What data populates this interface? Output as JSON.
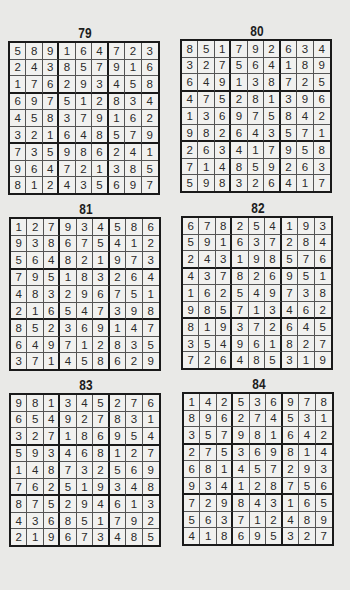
{
  "puzzles": [
    {
      "number": "79",
      "grid": [
        [
          5,
          8,
          9,
          1,
          6,
          4,
          7,
          2,
          3
        ],
        [
          2,
          4,
          3,
          8,
          5,
          7,
          9,
          1,
          6
        ],
        [
          1,
          7,
          6,
          2,
          9,
          3,
          4,
          5,
          8
        ],
        [
          6,
          9,
          7,
          5,
          1,
          2,
          8,
          3,
          4
        ],
        [
          4,
          5,
          8,
          3,
          7,
          9,
          1,
          6,
          2
        ],
        [
          3,
          2,
          1,
          6,
          4,
          8,
          5,
          7,
          9
        ],
        [
          7,
          3,
          5,
          9,
          8,
          6,
          2,
          4,
          1
        ],
        [
          9,
          6,
          4,
          7,
          2,
          1,
          3,
          8,
          5
        ],
        [
          8,
          1,
          2,
          4,
          3,
          5,
          6,
          9,
          7
        ]
      ]
    },
    {
      "number": "80",
      "grid": [
        [
          8,
          5,
          1,
          7,
          9,
          2,
          6,
          3,
          4
        ],
        [
          3,
          2,
          7,
          5,
          6,
          4,
          1,
          8,
          9
        ],
        [
          6,
          4,
          9,
          1,
          3,
          8,
          7,
          2,
          5
        ],
        [
          4,
          7,
          5,
          2,
          8,
          1,
          3,
          9,
          6
        ],
        [
          1,
          3,
          6,
          9,
          7,
          5,
          8,
          4,
          2
        ],
        [
          9,
          8,
          2,
          6,
          4,
          3,
          5,
          7,
          1
        ],
        [
          2,
          6,
          3,
          4,
          1,
          7,
          9,
          5,
          8
        ],
        [
          7,
          1,
          4,
          8,
          5,
          9,
          2,
          6,
          3
        ],
        [
          5,
          9,
          8,
          3,
          2,
          6,
          4,
          1,
          7
        ]
      ]
    },
    {
      "number": "81",
      "grid": [
        [
          1,
          2,
          7,
          9,
          3,
          4,
          5,
          8,
          6
        ],
        [
          9,
          3,
          8,
          6,
          7,
          5,
          4,
          1,
          2
        ],
        [
          5,
          6,
          4,
          8,
          2,
          1,
          9,
          7,
          3
        ],
        [
          7,
          9,
          5,
          1,
          8,
          3,
          2,
          6,
          4
        ],
        [
          4,
          8,
          3,
          2,
          9,
          6,
          7,
          5,
          1
        ],
        [
          2,
          1,
          6,
          5,
          4,
          7,
          3,
          9,
          8
        ],
        [
          8,
          5,
          2,
          3,
          6,
          9,
          1,
          4,
          7
        ],
        [
          6,
          4,
          9,
          7,
          1,
          2,
          8,
          3,
          5
        ],
        [
          3,
          7,
          1,
          4,
          5,
          8,
          6,
          2,
          9
        ]
      ]
    },
    {
      "number": "82",
      "grid": [
        [
          6,
          7,
          8,
          2,
          5,
          4,
          1,
          9,
          3
        ],
        [
          5,
          9,
          1,
          6,
          3,
          7,
          2,
          8,
          4
        ],
        [
          2,
          4,
          3,
          1,
          9,
          8,
          5,
          7,
          6
        ],
        [
          4,
          3,
          7,
          8,
          2,
          6,
          9,
          5,
          1
        ],
        [
          1,
          6,
          2,
          5,
          4,
          9,
          7,
          3,
          8
        ],
        [
          9,
          8,
          5,
          7,
          1,
          3,
          4,
          6,
          2
        ],
        [
          8,
          1,
          9,
          3,
          7,
          2,
          6,
          4,
          5
        ],
        [
          3,
          5,
          4,
          9,
          6,
          1,
          8,
          2,
          7
        ],
        [
          7,
          2,
          6,
          4,
          8,
          5,
          3,
          1,
          9
        ]
      ]
    },
    {
      "number": "83",
      "grid": [
        [
          9,
          8,
          1,
          3,
          4,
          5,
          2,
          7,
          6
        ],
        [
          6,
          5,
          4,
          9,
          2,
          7,
          8,
          3,
          1
        ],
        [
          3,
          2,
          7,
          1,
          8,
          6,
          9,
          5,
          4
        ],
        [
          5,
          9,
          3,
          4,
          6,
          8,
          1,
          2,
          7
        ],
        [
          1,
          4,
          8,
          7,
          3,
          2,
          5,
          6,
          9
        ],
        [
          7,
          6,
          2,
          5,
          1,
          9,
          3,
          4,
          8
        ],
        [
          8,
          7,
          5,
          2,
          9,
          4,
          6,
          1,
          3
        ],
        [
          4,
          3,
          6,
          8,
          5,
          1,
          7,
          9,
          2
        ],
        [
          2,
          1,
          9,
          6,
          7,
          3,
          4,
          8,
          5
        ]
      ]
    },
    {
      "number": "84",
      "grid": [
        [
          1,
          4,
          2,
          5,
          3,
          6,
          9,
          7,
          8
        ],
        [
          8,
          9,
          6,
          2,
          7,
          4,
          5,
          3,
          1
        ],
        [
          3,
          5,
          7,
          9,
          8,
          1,
          6,
          4,
          2
        ],
        [
          2,
          7,
          5,
          3,
          6,
          9,
          8,
          1,
          4
        ],
        [
          6,
          8,
          1,
          4,
          5,
          7,
          2,
          9,
          3
        ],
        [
          9,
          3,
          4,
          1,
          2,
          8,
          7,
          5,
          6
        ],
        [
          7,
          2,
          9,
          8,
          4,
          3,
          1,
          6,
          5
        ],
        [
          5,
          6,
          3,
          7,
          1,
          2,
          4,
          8,
          9
        ],
        [
          4,
          1,
          8,
          6,
          9,
          5,
          3,
          2,
          7
        ]
      ]
    }
  ]
}
